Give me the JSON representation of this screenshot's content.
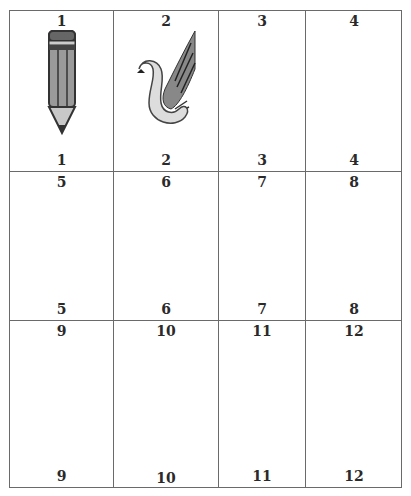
{
  "worksheet": {
    "rows": [
      [
        {
          "top": "1",
          "bottom": "1",
          "picture": "pencil"
        },
        {
          "top": "2",
          "bottom": "2",
          "picture": "swan"
        },
        {
          "top": "3",
          "bottom": "3",
          "picture": ""
        },
        {
          "top": "4",
          "bottom": "4",
          "picture": ""
        }
      ],
      [
        {
          "top": "5",
          "bottom": "5",
          "picture": ""
        },
        {
          "top": "6",
          "bottom": "6",
          "picture": ""
        },
        {
          "top": "7",
          "bottom": "7",
          "picture": ""
        },
        {
          "top": "8",
          "bottom": "8",
          "picture": ""
        }
      ],
      [
        {
          "top": "9",
          "bottom": "9",
          "picture": ""
        },
        {
          "top": "10",
          "bottom": "10",
          "picture": ""
        },
        {
          "top": "11",
          "bottom": "11",
          "picture": ""
        },
        {
          "top": "12",
          "bottom": "12",
          "picture": ""
        }
      ]
    ]
  }
}
